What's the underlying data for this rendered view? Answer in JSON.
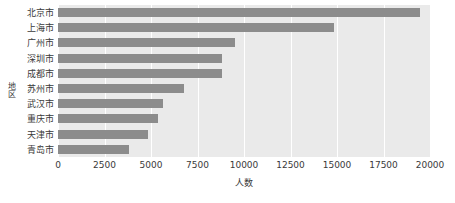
{
  "chart_data": {
    "type": "bar",
    "orientation": "horizontal",
    "title": "",
    "xlabel": "人数",
    "ylabel": "地区",
    "categories": [
      "北京市",
      "上海市",
      "广州市",
      "深圳市",
      "成都市",
      "苏州市",
      "武汉市",
      "重庆市",
      "天津市",
      "青岛市"
    ],
    "values": [
      19460,
      14840,
      9500,
      8800,
      8800,
      6800,
      5650,
      5400,
      4840,
      3820
    ],
    "xlim": [
      0,
      20000
    ],
    "xticks": [
      0,
      2500,
      5000,
      7500,
      10000,
      12500,
      15000,
      17500,
      20000
    ],
    "xtick_labels": [
      "0",
      "2500",
      "5000",
      "7500",
      "10000",
      "12500",
      "15000",
      "17500",
      "20000"
    ],
    "grid": "vertical",
    "legend": "none",
    "colors": {
      "bar": "#8c8c8c",
      "plot_background": "#eaeaea",
      "gridline": "#ffffff",
      "text": "#3a3a3a",
      "figure_background": "#ffffff"
    }
  }
}
